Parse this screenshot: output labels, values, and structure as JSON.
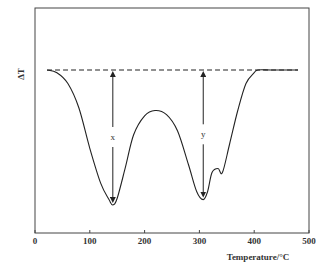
{
  "chart_data": {
    "type": "line",
    "title": "",
    "xlabel": "Temperature/°C",
    "ylabel": "ΔT",
    "xlim": [
      0,
      500
    ],
    "xticks": [
      0,
      100,
      200,
      300,
      400,
      500
    ],
    "xtick_labels": [
      "0",
      "100",
      "200",
      "300",
      "400",
      "500"
    ],
    "grid": false,
    "legend": null,
    "series": [
      {
        "name": "DTA curve",
        "style": "solid",
        "x": [
          22,
          40,
          60,
          80,
          100,
          120,
          135,
          142,
          150,
          165,
          180,
          200,
          219,
          240,
          260,
          280,
          295,
          307,
          315,
          323,
          334,
          342,
          355,
          370,
          385,
          400,
          407,
          430,
          460,
          480
        ],
        "y": [
          0,
          -2,
          -10,
          -28,
          -58,
          -84,
          -96,
          -100,
          -95,
          -72,
          -48,
          -34,
          -30,
          -33,
          -45,
          -70,
          -90,
          -96,
          -90,
          -76,
          -73,
          -76,
          -55,
          -30,
          -10,
          -2,
          0,
          0,
          0,
          0
        ]
      },
      {
        "name": "baseline",
        "style": "dashed",
        "x": [
          22,
          480
        ],
        "y": [
          0,
          0
        ]
      }
    ],
    "annotations": [
      {
        "label": "x",
        "type": "double-arrow",
        "x": 142,
        "y_from": 0,
        "y_to": -100
      },
      {
        "label": "y",
        "type": "double-arrow",
        "x": 307,
        "y_from": 0,
        "y_to": -96
      }
    ],
    "y_units": "relative ΔT (baseline = 0, deepest peak = -100)"
  },
  "labels": {
    "ylabel": "ΔT",
    "xlabel": "Temperature/°C",
    "x_marker": "x",
    "y_marker": "y",
    "ticks": [
      "0",
      "100",
      "200",
      "300",
      "400",
      "500"
    ]
  }
}
